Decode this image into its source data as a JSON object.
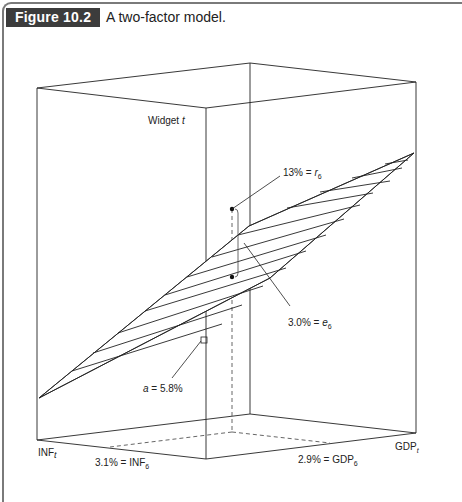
{
  "figure": {
    "label": "Figure 10.2",
    "title": "A two-factor model."
  },
  "diagram": {
    "type": "3d-plane",
    "axes": {
      "vertical": {
        "name": "Widget",
        "sub": "t"
      },
      "left": {
        "name": "INF",
        "sub": "t"
      },
      "right": {
        "name": "GDP",
        "sub": "t"
      }
    },
    "annotations": {
      "r6": {
        "value": "13% = ",
        "sym": "r",
        "sub": "6"
      },
      "e6": {
        "value": "3.0% = ",
        "sym": "e",
        "sub": "6"
      },
      "a": {
        "sym": "a",
        "value": " = 5.8%"
      },
      "inf6": {
        "value": "3.1% = INF",
        "sub": "6"
      },
      "gdp6": {
        "value": "2.9% = GDP",
        "sub": "6"
      }
    },
    "colors": {
      "line": "#222222",
      "dashed": "#555555",
      "label_bg": "#3c3c3c",
      "frame": "#7a7a7a"
    }
  }
}
